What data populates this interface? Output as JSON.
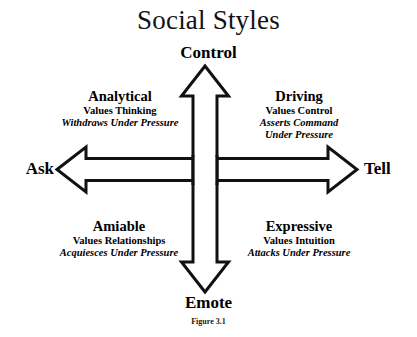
{
  "figure": {
    "title": "Social Styles",
    "caption": "Figure 3.1",
    "stroke_color": "#111111",
    "fill_color": "#ffffff",
    "text_color": "#000000"
  },
  "axes": {
    "vertical": {
      "top_label": "Control",
      "bottom_label": "Emote"
    },
    "horizontal": {
      "left_label": "Ask",
      "right_label": "Tell"
    }
  },
  "quadrants": [
    {
      "id": "analytical",
      "position": "top-left",
      "name": "Analytical",
      "values": "Values Thinking",
      "pressure_lines": [
        "Withdraws Under Pressure"
      ]
    },
    {
      "id": "driving",
      "position": "top-right",
      "name": "Driving",
      "values": "Values Control",
      "pressure_lines": [
        "Asserts Command",
        "Under Pressure"
      ]
    },
    {
      "id": "amiable",
      "position": "bottom-left",
      "name": "Amiable",
      "values": "Values Relationships",
      "pressure_lines": [
        "Acquiesces Under Pressure"
      ]
    },
    {
      "id": "expressive",
      "position": "bottom-right",
      "name": "Expressive",
      "values": "Values Intuition",
      "pressure_lines": [
        "Attacks Under Pressure"
      ]
    }
  ]
}
